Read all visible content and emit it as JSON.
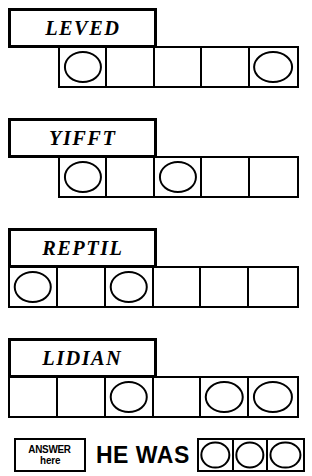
{
  "puzzle": {
    "type": "word-jumble",
    "answer_prompt": "HE WAS",
    "answer_tag_line1": "ANSWER",
    "answer_tag_line2": "here",
    "answer_cell_count": 3,
    "answer_cells": [
      "",
      "",
      ""
    ],
    "ink_color": "#000000",
    "paper_color": "#ffffff",
    "rows": [
      {
        "word": "LEVED",
        "cell_count": 5,
        "cells": [
          "",
          "",
          "",
          "",
          ""
        ],
        "circled_indexes": [
          0,
          4
        ]
      },
      {
        "word": "YIFFT",
        "cell_count": 5,
        "cells": [
          "",
          "",
          "",
          "",
          ""
        ],
        "circled_indexes": [
          0,
          2
        ]
      },
      {
        "word": "REPTIL",
        "cell_count": 6,
        "cells": [
          "",
          "",
          "",
          "",
          "",
          ""
        ],
        "circled_indexes": [
          0,
          2
        ]
      },
      {
        "word": "LIDIAN",
        "cell_count": 6,
        "cells": [
          "",
          "",
          "",
          "",
          "",
          ""
        ],
        "circled_indexes": [
          2,
          4,
          5
        ]
      }
    ]
  }
}
